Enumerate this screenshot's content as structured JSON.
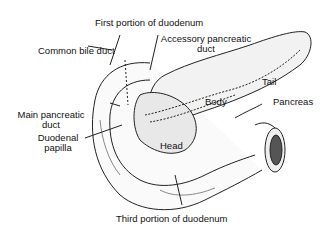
{
  "figure": {
    "labels": {
      "first_portion": "First portion of duodenum",
      "common_bile_duct": "Common bile duct",
      "accessory_duct_line1": "Accessory pancreatic",
      "accessory_duct_line2": "duct",
      "tail": "Tail",
      "body": "Body",
      "pancreas": "Pancreas",
      "main_duct_line1": "Main pancreatic",
      "main_duct_line2": "duct",
      "papilla_line1": "Duodenal",
      "papilla_line2": "papilla",
      "head": "Head",
      "third_portion": "Third portion of duodenum"
    }
  }
}
